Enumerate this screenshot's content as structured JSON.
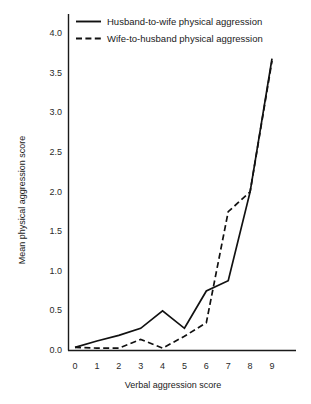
{
  "chart_data": {
    "type": "line",
    "title": "",
    "xlabel": "Verbal aggression score",
    "ylabel": "Mean physical aggression score",
    "x": [
      0,
      1,
      2,
      3,
      4,
      5,
      6,
      7,
      8,
      9
    ],
    "xlim": [
      0,
      9
    ],
    "ylim": [
      0.0,
      4.0
    ],
    "xtick_labels": [
      "0",
      "1",
      "2",
      "3",
      "4",
      "5",
      "6",
      "7",
      "8",
      "9"
    ],
    "ytick_labels": [
      "0.0",
      "0.5",
      "1.0",
      "1.5",
      "2.0",
      "2.5",
      "3.0",
      "3.5",
      "4.0"
    ],
    "ytick_values": [
      0.0,
      0.5,
      1.0,
      1.5,
      2.0,
      2.5,
      3.0,
      3.5,
      4.0
    ],
    "grid": false,
    "legend_position": "top-left",
    "series": [
      {
        "name": "Husband-to-wife physical aggression",
        "style": "solid",
        "color": "#111111",
        "values": [
          0.04,
          0.12,
          0.19,
          0.28,
          0.5,
          0.28,
          0.75,
          0.88,
          2.0,
          3.68
        ]
      },
      {
        "name": "Wife-to-husband physical aggression",
        "style": "dashed",
        "color": "#111111",
        "values": [
          0.04,
          0.03,
          0.03,
          0.14,
          0.03,
          0.18,
          0.35,
          1.75,
          2.0,
          3.65
        ]
      }
    ]
  },
  "legend": {
    "entries": [
      {
        "label": "Husband-to-wife physical aggression"
      },
      {
        "label": "Wife-to-husband physical aggression"
      }
    ]
  },
  "axes": {
    "x_title": "Verbal aggression score",
    "y_title": "Mean physical aggression score"
  }
}
